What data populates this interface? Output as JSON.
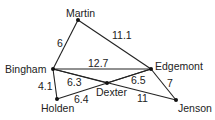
{
  "graph": {
    "nodes": [
      {
        "id": "martin",
        "label": "Martin",
        "x": 78,
        "y": 20,
        "lx": 66,
        "ly": 17
      },
      {
        "id": "bingham",
        "label": "Bingham",
        "x": 53,
        "y": 69,
        "lx": 5,
        "ly": 73
      },
      {
        "id": "edgemont",
        "label": "Edgemont",
        "x": 151,
        "y": 69,
        "lx": 155,
        "ly": 70
      },
      {
        "id": "holden",
        "label": "Holden",
        "x": 57,
        "y": 99,
        "lx": 41,
        "ly": 112
      },
      {
        "id": "dexter",
        "label": "Dexter",
        "x": 107,
        "y": 83,
        "lx": 96,
        "ly": 96
      },
      {
        "id": "jenson",
        "label": "Jenson",
        "x": 176,
        "y": 100,
        "lx": 178,
        "ly": 112
      }
    ],
    "edges": [
      {
        "from": "martin",
        "to": "bingham",
        "weight": "6",
        "wx": 57,
        "wy": 47
      },
      {
        "from": "martin",
        "to": "edgemont",
        "weight": "11.1",
        "wx": 112,
        "wy": 39
      },
      {
        "from": "bingham",
        "to": "edgemont",
        "weight": "12.7",
        "wx": 88,
        "wy": 67
      },
      {
        "from": "bingham",
        "to": "holden",
        "weight": "4.1",
        "wx": 38,
        "wy": 90
      },
      {
        "from": "bingham",
        "to": "jenson",
        "weight": "11",
        "wx": 137,
        "wy": 102
      },
      {
        "from": "holden",
        "to": "edgemont",
        "weight": "6.4",
        "wx": 74,
        "wy": 103
      },
      {
        "from": "edgemont",
        "to": "jenson",
        "weight": "7",
        "wx": 167,
        "wy": 87
      },
      {
        "from": "bingham",
        "to": "dexter",
        "weight": "6.3",
        "wx": 67,
        "wy": 86
      },
      {
        "from": "dexter",
        "to": "edgemont",
        "weight": "6.5",
        "wx": 131,
        "wy": 84
      }
    ]
  }
}
